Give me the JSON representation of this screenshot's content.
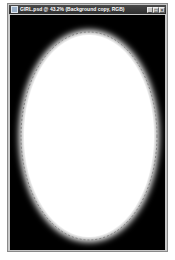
{
  "window": {
    "title": "GIRL.psd @ 43.2% (Background copy, RGB)",
    "controls": [
      {
        "name": "minimize",
        "glyph": "_"
      },
      {
        "name": "maximize",
        "glyph": "□"
      },
      {
        "name": "close",
        "glyph": "×"
      }
    ]
  },
  "canvas": {
    "background": "#000000",
    "ellipse": {
      "fill": "#ffffff",
      "cx": 79,
      "cy": 121,
      "rx": 70,
      "ry": 108,
      "feathered": true,
      "selection": "dashed marching-ants outline"
    }
  }
}
